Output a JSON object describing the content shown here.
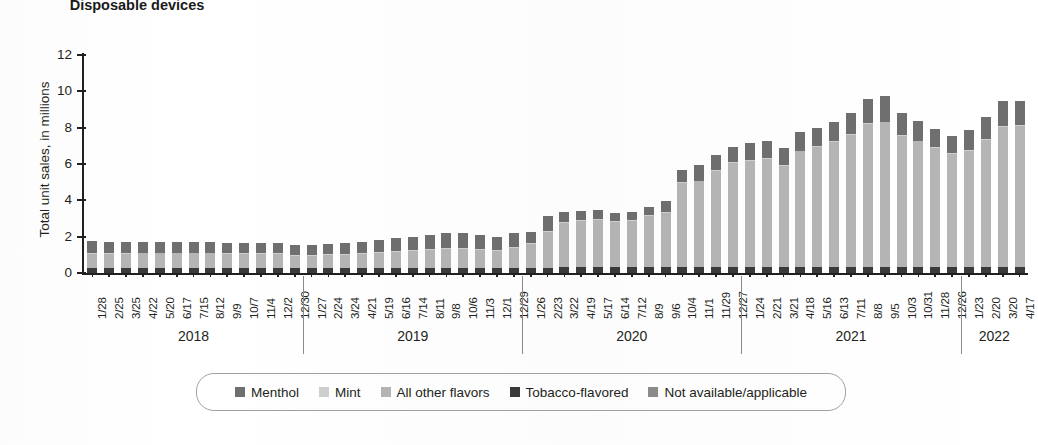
{
  "title": "Disposable\ndevices",
  "axes": {
    "ylabel": "Total unit sales, in millions",
    "yticks": [
      "0",
      "2",
      "4",
      "6",
      "8",
      "10",
      "12"
    ],
    "ymin": 0,
    "ymax": 12
  },
  "legend": {
    "items": [
      {
        "label": "Menthol",
        "color": "#6f6f6f"
      },
      {
        "label": "Mint",
        "color": "#cfcfcf"
      },
      {
        "label": "All other flavors",
        "color": "#b5b5b5"
      },
      {
        "label": "Tobacco-flavored",
        "color": "#3a3a3a"
      },
      {
        "label": "Not available/applicable",
        "color": "#8c8c8c"
      }
    ]
  },
  "years": [
    {
      "label": "2018",
      "count": 13
    },
    {
      "label": "2019",
      "count": 13
    },
    {
      "label": "2020",
      "count": 13
    },
    {
      "label": "2021",
      "count": 13
    },
    {
      "label": "2022",
      "count": 4
    }
  ],
  "chart_data": {
    "type": "bar",
    "stacked": true,
    "title": "Disposable devices",
    "xlabel": "",
    "ylabel": "Total unit sales, in millions",
    "ylim": [
      0,
      12
    ],
    "grid": false,
    "legend_position": "bottom",
    "categories": [
      "1/28",
      "2/25",
      "3/25",
      "4/22",
      "5/20",
      "6/17",
      "7/15",
      "8/12",
      "9/9",
      "10/7",
      "11/4",
      "12/2",
      "12/30",
      "1/27",
      "2/24",
      "3/24",
      "4/21",
      "5/19",
      "6/16",
      "7/14",
      "8/11",
      "9/8",
      "10/6",
      "11/3",
      "12/1",
      "12/29",
      "1/26",
      "2/23",
      "3/22",
      "4/19",
      "5/17",
      "6/14",
      "7/12",
      "8/9",
      "9/6",
      "10/4",
      "11/1",
      "11/29",
      "12/27",
      "1/24",
      "2/21",
      "3/21",
      "4/18",
      "5/16",
      "6/13",
      "7/11",
      "8/8",
      "9/5",
      "10/3",
      "10/31",
      "11/28",
      "12/26",
      "1/23",
      "2/20",
      "3/20",
      "4/17"
    ],
    "series": [
      {
        "name": "Tobacco-flavored",
        "color": "#3a3a3a",
        "values": [
          0.3,
          0.3,
          0.3,
          0.3,
          0.3,
          0.3,
          0.3,
          0.3,
          0.28,
          0.28,
          0.28,
          0.28,
          0.26,
          0.26,
          0.26,
          0.26,
          0.26,
          0.26,
          0.26,
          0.26,
          0.26,
          0.26,
          0.26,
          0.26,
          0.26,
          0.26,
          0.26,
          0.28,
          0.32,
          0.32,
          0.32,
          0.32,
          0.32,
          0.32,
          0.32,
          0.34,
          0.34,
          0.34,
          0.34,
          0.34,
          0.34,
          0.34,
          0.34,
          0.34,
          0.34,
          0.34,
          0.34,
          0.34,
          0.34,
          0.34,
          0.34,
          0.34,
          0.34,
          0.34,
          0.34,
          0.34
        ]
      },
      {
        "name": "All other flavors",
        "color": "#b5b5b5",
        "values": [
          0.75,
          0.75,
          0.75,
          0.78,
          0.78,
          0.78,
          0.78,
          0.78,
          0.75,
          0.75,
          0.75,
          0.75,
          0.7,
          0.7,
          0.72,
          0.75,
          0.8,
          0.85,
          0.9,
          0.95,
          1.0,
          1.05,
          1.05,
          1.0,
          0.95,
          1.1,
          1.35,
          2.0,
          2.45,
          2.55,
          2.6,
          2.5,
          2.55,
          2.8,
          3.0,
          4.6,
          4.7,
          5.3,
          5.7,
          5.85,
          5.95,
          5.55,
          6.35,
          6.6,
          6.85,
          7.25,
          7.85,
          7.95,
          7.2,
          6.9,
          6.55,
          6.2,
          6.4,
          7.0,
          7.7,
          7.75
        ]
      },
      {
        "name": "Mint",
        "color": "#cfcfcf",
        "values": [
          0.05,
          0.05,
          0.05,
          0.05,
          0.05,
          0.05,
          0.05,
          0.05,
          0.05,
          0.05,
          0.05,
          0.05,
          0.05,
          0.05,
          0.05,
          0.05,
          0.05,
          0.05,
          0.05,
          0.05,
          0.05,
          0.05,
          0.05,
          0.05,
          0.05,
          0.05,
          0.05,
          0.05,
          0.05,
          0.05,
          0.05,
          0.05,
          0.05,
          0.05,
          0.05,
          0.05,
          0.05,
          0.05,
          0.05,
          0.05,
          0.05,
          0.05,
          0.05,
          0.05,
          0.05,
          0.05,
          0.05,
          0.05,
          0.05,
          0.05,
          0.05,
          0.05,
          0.05,
          0.05,
          0.05,
          0.05
        ]
      },
      {
        "name": "Menthol",
        "color": "#6f6f6f",
        "values": [
          0.65,
          0.62,
          0.62,
          0.6,
          0.6,
          0.6,
          0.6,
          0.6,
          0.6,
          0.58,
          0.58,
          0.58,
          0.55,
          0.55,
          0.55,
          0.58,
          0.6,
          0.65,
          0.7,
          0.75,
          0.8,
          0.85,
          0.85,
          0.8,
          0.75,
          0.8,
          0.6,
          0.8,
          0.55,
          0.5,
          0.5,
          0.45,
          0.45,
          0.45,
          0.6,
          0.7,
          0.85,
          0.8,
          0.85,
          0.9,
          0.95,
          0.95,
          1.0,
          1.0,
          1.1,
          1.15,
          1.35,
          1.4,
          1.2,
          1.1,
          1.0,
          0.95,
          1.1,
          1.2,
          1.4,
          1.35
        ]
      }
    ],
    "totals": [
      1.75,
      1.72,
      1.72,
      1.73,
      1.73,
      1.73,
      1.73,
      1.73,
      1.68,
      1.66,
      1.66,
      1.66,
      1.56,
      1.56,
      1.58,
      1.64,
      1.71,
      1.81,
      1.91,
      2.01,
      2.11,
      2.21,
      2.21,
      2.11,
      2.01,
      2.21,
      2.26,
      3.13,
      3.37,
      3.42,
      3.47,
      3.32,
      3.37,
      3.62,
      3.97,
      5.69,
      5.94,
      6.49,
      6.94,
      7.14,
      7.29,
      6.89,
      7.74,
      7.99,
      8.34,
      8.79,
      9.59,
      9.74,
      8.79,
      8.39,
      7.94,
      7.54,
      7.89,
      8.59,
      9.49,
      9.49
    ]
  }
}
